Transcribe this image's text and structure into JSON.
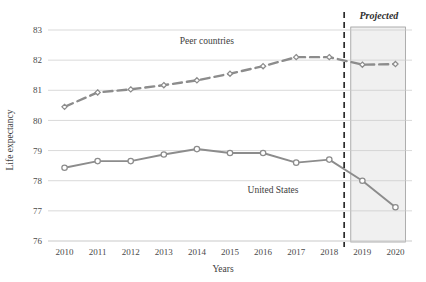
{
  "chart_data": {
    "type": "line",
    "title": "",
    "xlabel": "Years",
    "ylabel": "Life expectancy",
    "categories": [
      "2010",
      "2011",
      "2012",
      "2013",
      "2014",
      "2015",
      "2016",
      "2017",
      "2018",
      "2019",
      "2020"
    ],
    "x": [
      2010,
      2011,
      2012,
      2013,
      2014,
      2015,
      2016,
      2017,
      2018,
      2019,
      2020
    ],
    "xlim": [
      2009.5,
      2020.5
    ],
    "ylim": [
      76,
      83
    ],
    "yticks": [
      76,
      77,
      78,
      79,
      80,
      81,
      82,
      83
    ],
    "ytick_labels": [
      "76",
      "77",
      "78",
      "79",
      "80",
      "81",
      "82",
      "83"
    ],
    "grid": true,
    "grid_axis": "y",
    "legend": "inline-annotations",
    "series": [
      {
        "name": "Peer countries",
        "style": "dashed",
        "marker": "open-diamond",
        "color": "#8c8c8c",
        "values": [
          80.45,
          80.93,
          81.03,
          81.17,
          81.33,
          81.55,
          81.8,
          82.1,
          82.1,
          81.85,
          81.87
        ]
      },
      {
        "name": "United States",
        "style": "solid",
        "marker": "open-circle",
        "color": "#8c8c8c",
        "values": [
          78.43,
          78.65,
          78.65,
          78.87,
          79.05,
          78.92,
          78.92,
          78.6,
          78.7,
          78.0,
          77.12
        ]
      }
    ],
    "annotations": [
      {
        "text": "Peer countries",
        "x": 2014.3,
        "y": 82.52
      },
      {
        "text": "United States",
        "x": 2016.3,
        "y": 77.58
      },
      {
        "text": "Projected",
        "x": 2019.5,
        "y": 83.35
      }
    ],
    "projection": {
      "label": "Projected",
      "divider_x": 2018.45,
      "shaded_from": 2018.65,
      "shaded_to": 2020.3,
      "shade_color": "#f0f0f0",
      "border_color": "#9a9a9a",
      "divider_style": "dashed",
      "divider_color": "#2a2a2a"
    }
  },
  "axes": {
    "y_label": "Life expectancy",
    "x_label": "Years",
    "y_ticks": [
      "83",
      "82",
      "81",
      "80",
      "79",
      "78",
      "77",
      "76"
    ],
    "x_ticks": [
      "2010",
      "2011",
      "2012",
      "2013",
      "2014",
      "2015",
      "2016",
      "2017",
      "2018",
      "2019",
      "2020"
    ]
  },
  "labels": {
    "peer_countries": "Peer countries",
    "united_states": "United States",
    "projected": "Projected"
  },
  "colors": {
    "line": "#8c8c8c",
    "grid": "#c9c9c9",
    "shade": "#f0f0f0",
    "shade_border": "#9a9a9a",
    "divider": "#2a2a2a",
    "text": "#3d3d3d"
  }
}
